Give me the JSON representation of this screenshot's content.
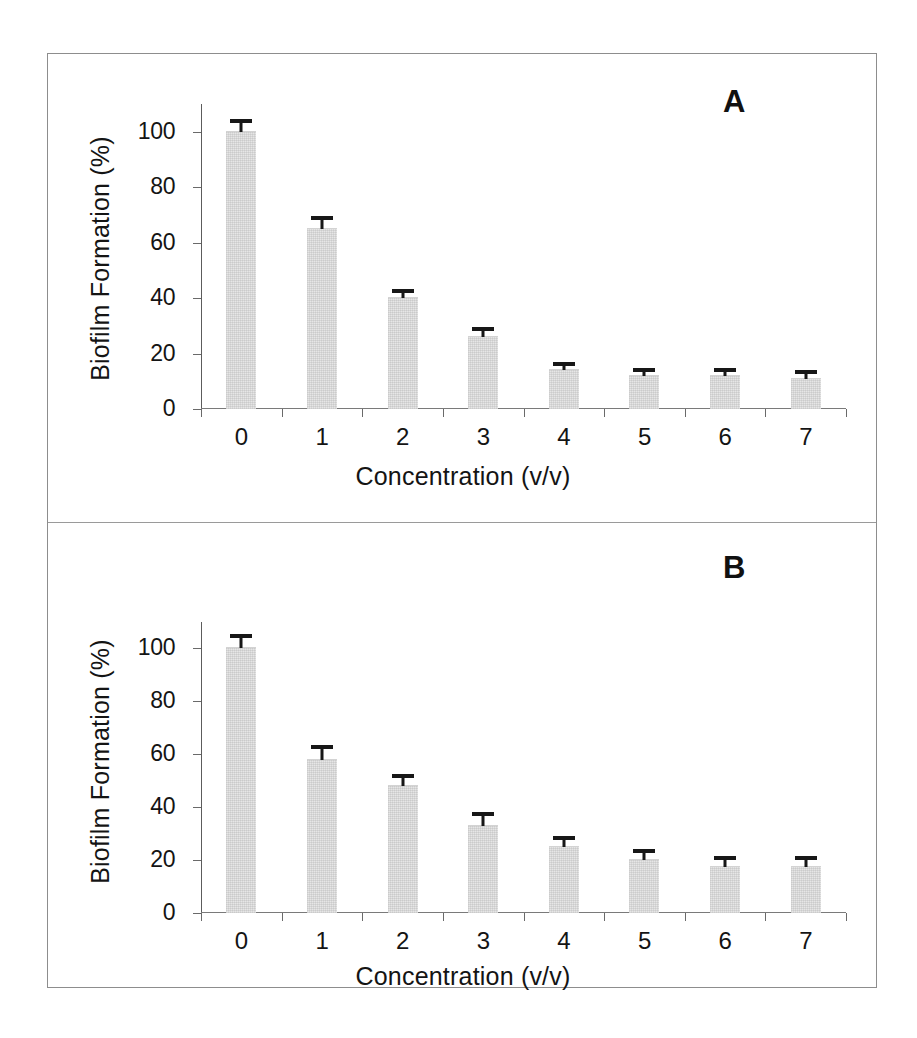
{
  "figure": {
    "panel_a_letter": "A",
    "panel_b_letter": "B"
  },
  "chart_data": [
    {
      "type": "bar",
      "title": "A",
      "panel": "A",
      "categories": [
        "0",
        "1",
        "2",
        "3",
        "4",
        "5",
        "6",
        "7"
      ],
      "values": [
        100,
        65,
        40,
        26,
        14,
        12,
        12,
        11
      ],
      "errors": [
        3,
        3,
        2,
        2,
        1.5,
        1.5,
        1.5,
        1.5
      ],
      "xlabel": "Concentration (v/v)",
      "ylabel": "Biofilm Formation (%)",
      "ylim": [
        0,
        110
      ],
      "yticks": [
        0,
        20,
        40,
        60,
        80,
        100
      ],
      "ytick_labels": [
        "0",
        "20",
        "40",
        "60",
        "80",
        "100"
      ],
      "grid": false,
      "legend": false,
      "bar_color": "#e6e6e6",
      "error_color": "#171717"
    },
    {
      "type": "bar",
      "title": "B",
      "panel": "B",
      "categories": [
        "0",
        "1",
        "2",
        "3",
        "4",
        "5",
        "6",
        "7"
      ],
      "values": [
        100,
        58,
        48,
        33,
        25,
        20,
        17.5,
        17.5
      ],
      "errors": [
        4,
        4,
        3,
        3.5,
        2.5,
        2.5,
        2.5,
        2.5
      ],
      "xlabel": "Concentration (v/v)",
      "ylabel": "Biofilm Formation (%)",
      "ylim": [
        0,
        110
      ],
      "yticks": [
        0,
        20,
        40,
        60,
        80,
        100
      ],
      "ytick_labels": [
        "0",
        "20",
        "40",
        "60",
        "80",
        "100"
      ],
      "grid": false,
      "legend": false,
      "bar_color": "#e6e6e6",
      "error_color": "#171717"
    }
  ]
}
